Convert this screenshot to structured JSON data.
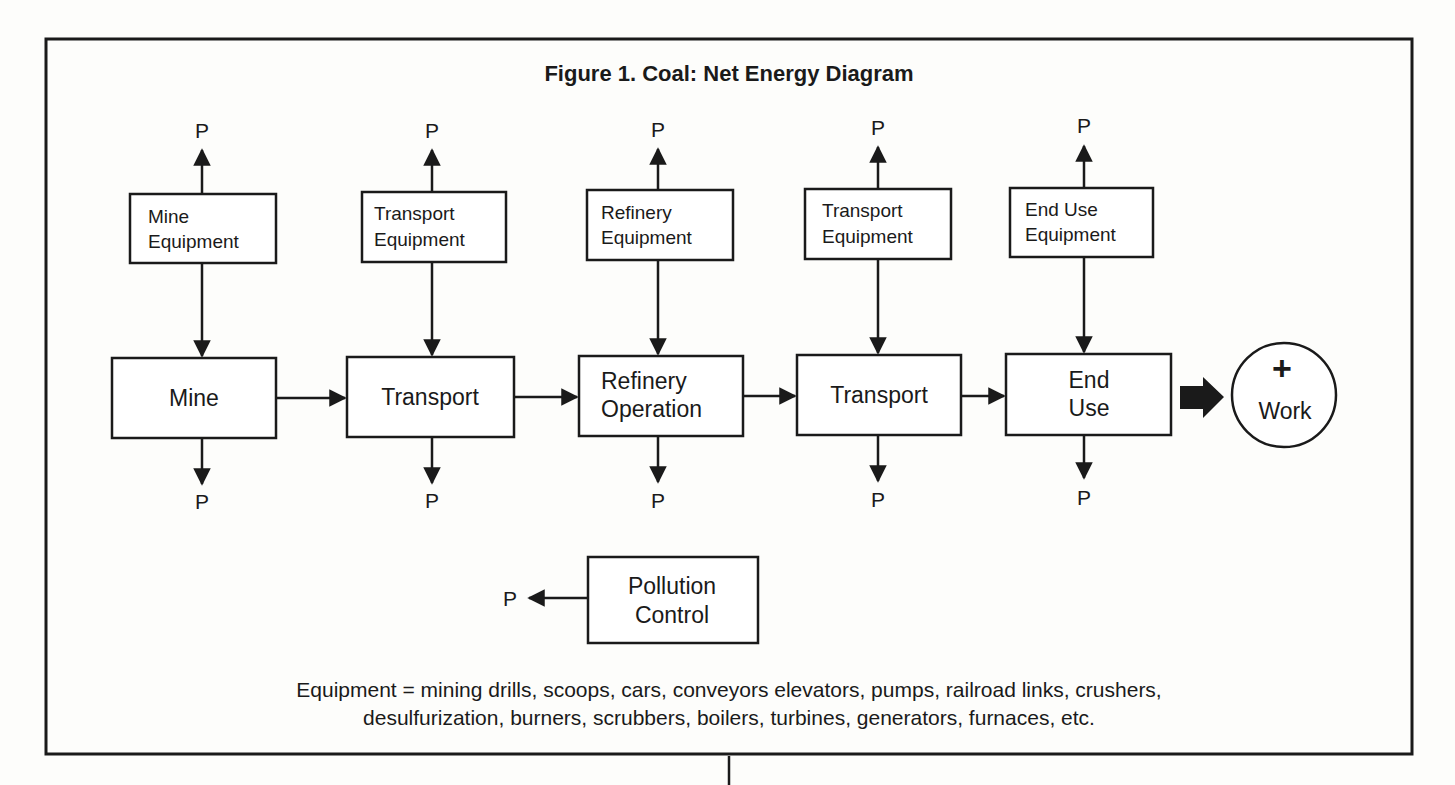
{
  "figure": {
    "title": "Figure 1.  Coal: Net Energy Diagram",
    "product_label": "P"
  },
  "equipment_boxes": [
    {
      "line1": "Mine",
      "line2": "Equipment"
    },
    {
      "line1": "Transport",
      "line2": "Equipment"
    },
    {
      "line1": "Refinery",
      "line2": "Equipment"
    },
    {
      "line1": "Transport",
      "line2": "Equipment"
    },
    {
      "line1": "End Use",
      "line2": "Equipment"
    }
  ],
  "process_boxes": [
    {
      "line1": "Mine",
      "line2": ""
    },
    {
      "line1": "Transport",
      "line2": ""
    },
    {
      "line1": "Refinery",
      "line2": "Operation"
    },
    {
      "line1": "Transport",
      "line2": ""
    },
    {
      "line1": "End",
      "line2": "Use"
    }
  ],
  "output": {
    "symbol": "+",
    "label": "Work"
  },
  "pollution_control": {
    "line1": "Pollution",
    "line2": "Control",
    "product_label": "P"
  },
  "caption": {
    "line1": "Equipment = mining drills, scoops, cars, conveyors elevators, pumps, railroad links, crushers,",
    "line2": "desulfurization, burners, scrubbers, boilers, turbines, generators, furnaces, etc."
  },
  "colors": {
    "ink": "#1a1a1a",
    "paper": "#fdfdfb"
  }
}
